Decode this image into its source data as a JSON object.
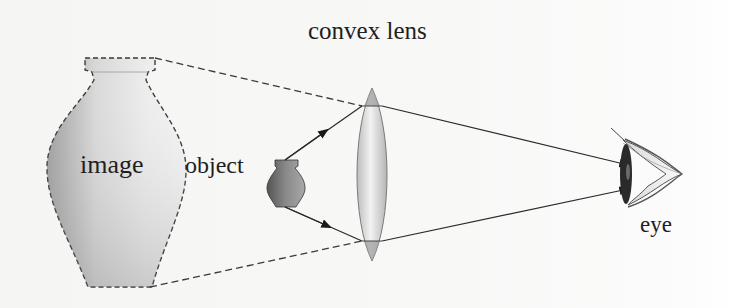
{
  "diagram": {
    "type": "ray diagram",
    "labels": {
      "image": "image",
      "object": "object",
      "lens": "convex lens",
      "eye": "eye"
    },
    "elements": [
      {
        "id": "image",
        "kind": "virtual image (large vase, dashed outline)"
      },
      {
        "id": "object",
        "kind": "real object (small vase)"
      },
      {
        "id": "lens",
        "kind": "convex (biconvex) lens"
      },
      {
        "id": "eye",
        "kind": "observer eye"
      }
    ],
    "rays": [
      {
        "from": "object top",
        "to": "lens top",
        "style": "solid",
        "arrow": true
      },
      {
        "from": "object bottom",
        "to": "lens bottom",
        "style": "solid",
        "arrow": true
      },
      {
        "from": "lens top",
        "to": "eye",
        "style": "solid",
        "arrow": true
      },
      {
        "from": "lens bottom",
        "to": "eye",
        "style": "solid",
        "arrow": true
      },
      {
        "from": "image top",
        "to": "lens top",
        "style": "dashed",
        "arrow": false
      },
      {
        "from": "image bottom",
        "to": "lens bottom",
        "style": "dashed",
        "arrow": false
      }
    ],
    "colors": {
      "line": "#333333",
      "vase_dark": "#7a7a7a",
      "vase_light": "#e6e6e6",
      "lens_edge": "#8a8a8a",
      "background": "#f7f7f6"
    }
  }
}
